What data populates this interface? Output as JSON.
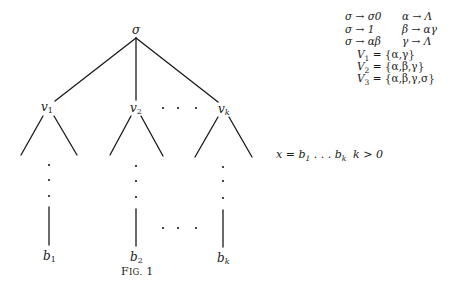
{
  "figure": {
    "caption_prefix": "F",
    "caption_smallcaps": "IG.",
    "caption_number": "1",
    "colors": {
      "ink": "#1a1a1a",
      "background": "#ffffff"
    }
  },
  "tree": {
    "root": {
      "label": "σ",
      "x": 136,
      "y": 30
    },
    "children": [
      {
        "label": "v",
        "sub": "1",
        "x": 46,
        "leaf": "b",
        "leaf_sub": "1"
      },
      {
        "label": "v",
        "sub": "2",
        "x": 135,
        "leaf": "b",
        "leaf_sub": "2"
      },
      {
        "label": "v",
        "sub": "k",
        "x": 223,
        "leaf": "b",
        "leaf_sub": "k"
      }
    ],
    "ellipsis": "· · ·"
  },
  "grammar": {
    "rules": [
      {
        "left": "σ → σ0",
        "right": "α → Λ"
      },
      {
        "left": "σ → 1",
        "right": "β → αγ"
      },
      {
        "left": "σ → αβ",
        "right": "γ → Λ"
      }
    ],
    "sets": [
      {
        "name": "V",
        "sub": "1",
        "value": "= {α,γ}"
      },
      {
        "name": "V",
        "sub": "2",
        "value": "= {α,β,γ}"
      },
      {
        "name": "V",
        "sub": "3",
        "value": "= {α,β,γ,σ}"
      }
    ]
  },
  "annotation": {
    "x_eq": "x = b",
    "b1_sub": "1",
    "dots": " . . . b",
    "bk_sub": "k",
    "condition": "k > 0"
  }
}
